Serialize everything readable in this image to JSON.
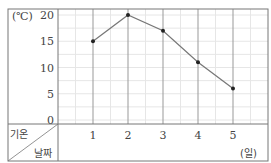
{
  "chart_data": {
    "type": "line",
    "title": "",
    "xlabel": "날짜",
    "ylabel": "기온",
    "y_unit": "(°C)",
    "x_unit": "(일)",
    "categories": [
      "1",
      "2",
      "3",
      "4",
      "5"
    ],
    "series": [
      {
        "name": "기온",
        "values": [
          15,
          20,
          17,
          11,
          6
        ]
      }
    ],
    "yticks": [
      "0",
      "5",
      "10",
      "15",
      "20"
    ],
    "ylim": [
      0,
      20
    ],
    "grid": true,
    "legend": "none"
  },
  "labels": {
    "y_unit": "(℃)",
    "x_unit": "(일)",
    "row_header": "기온",
    "col_header": "날짜"
  },
  "colors": {
    "line": "#777777",
    "point": "#222222",
    "grid_major": "#999999",
    "grid_minor": "#e6e6e6",
    "frame": "#777777"
  }
}
